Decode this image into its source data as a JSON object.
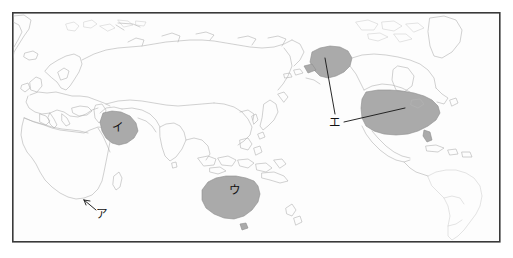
{
  "figure": {
    "kind": "world-map-outline",
    "title": "",
    "frame": {
      "x": 12,
      "y": 12,
      "width": 488,
      "height": 230,
      "stroke": "#3a3a3a"
    }
  },
  "palette": {
    "background": "#ffffff",
    "map_fill": "#fdfdfd",
    "coastline": "#b4b4b4",
    "coastline_faint": "#c8c8c8",
    "shaded_region": "#aaaaaa",
    "shaded_region_stroke": "#8d8d8d",
    "leader_line": "#1c1c1c",
    "label_text": "#111111"
  },
  "labels": [
    {
      "id": "a",
      "text": "ア",
      "x": 101,
      "y": 214,
      "region": "south-africa",
      "has_leader": true
    },
    {
      "id": "i",
      "text": "イ",
      "x": 117,
      "y": 127,
      "region": "saudi-arabia",
      "has_leader": false
    },
    {
      "id": "u",
      "text": "ウ",
      "x": 234,
      "y": 190,
      "region": "australia",
      "has_leader": false
    },
    {
      "id": "e",
      "text": "エ",
      "x": 334,
      "y": 122,
      "region": "united-states",
      "has_leader": true
    }
  ],
  "shaded_regions": [
    {
      "id": "south-africa",
      "name": "South Africa",
      "label": "ア"
    },
    {
      "id": "saudi-arabia",
      "name": "Saudi Arabia",
      "label": "イ"
    },
    {
      "id": "australia",
      "name": "Australia",
      "label": "ウ"
    },
    {
      "id": "united-states",
      "name": "United States",
      "label": "エ"
    },
    {
      "id": "alaska",
      "name": "Alaska",
      "label": "エ"
    }
  ],
  "leaders": [
    {
      "id": "leader-a",
      "from_label": "ア",
      "to_region": "south-africa"
    },
    {
      "id": "leader-e-alaska",
      "from_label": "エ",
      "to_region": "alaska"
    },
    {
      "id": "leader-e-usa",
      "from_label": "エ",
      "to_region": "united-states"
    }
  ]
}
